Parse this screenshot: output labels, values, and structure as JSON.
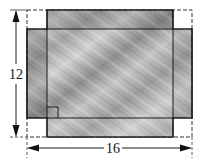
{
  "diagram": {
    "type": "box-net-with-corner-cutouts",
    "dimensions": {
      "height_label": "12",
      "width_label": "16"
    },
    "colors": {
      "fill_light": "#c8c8c8",
      "fill_dark": "#8e8e8e",
      "outline": "#1a1a1a",
      "dashed": "#333333"
    },
    "elements": {
      "outer_rect": {
        "style": "dashed"
      },
      "cross_shape": {
        "style": "solid",
        "texture": "wood-grain"
      },
      "corner_squares": [
        "top-left",
        "top-right",
        "bottom-left",
        "bottom-right"
      ],
      "right_angle_marker": {
        "position": "bottom-left-inner-corner"
      }
    }
  }
}
